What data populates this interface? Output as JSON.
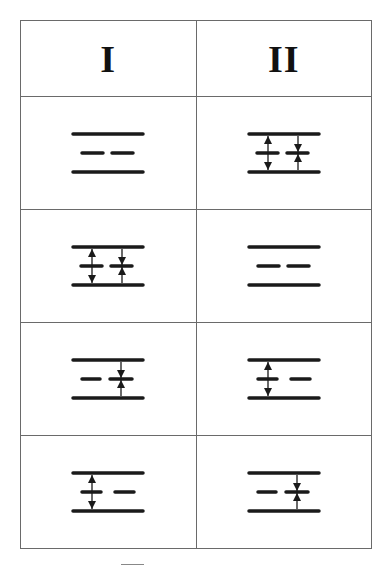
{
  "table": {
    "columns": [
      {
        "id": "col-1",
        "label": "I"
      },
      {
        "id": "col-2",
        "label": "II"
      }
    ],
    "rows": [
      {
        "cells": [
          {
            "column": "I",
            "diagram": "plates-no-arrows",
            "arrows": []
          },
          {
            "column": "II",
            "diagram": "plates-both-arrows",
            "arrows": [
              "double-arrow-left-through-dash",
              "converging-arrows-right-dash"
            ]
          }
        ]
      },
      {
        "cells": [
          {
            "column": "I",
            "diagram": "plates-both-arrows",
            "arrows": [
              "double-arrow-left-through-dash",
              "converging-arrows-right-dash"
            ]
          },
          {
            "column": "II",
            "diagram": "plates-no-arrows",
            "arrows": []
          }
        ]
      },
      {
        "cells": [
          {
            "column": "I",
            "diagram": "plates-right-converging-arrows",
            "arrows": [
              "converging-arrows-right-dash"
            ]
          },
          {
            "column": "II",
            "diagram": "plates-left-double-arrow",
            "arrows": [
              "double-arrow-left-through-dash"
            ]
          }
        ]
      },
      {
        "cells": [
          {
            "column": "I",
            "diagram": "plates-left-double-arrow",
            "arrows": [
              "double-arrow-left-through-dash"
            ]
          },
          {
            "column": "II",
            "diagram": "plates-right-converging-arrows",
            "arrows": [
              "converging-arrows-right-dash"
            ]
          }
        ]
      }
    ]
  },
  "colors": {
    "stroke": "#1a1a1a",
    "border": "#6a6a6a",
    "background": "#ffffff"
  }
}
